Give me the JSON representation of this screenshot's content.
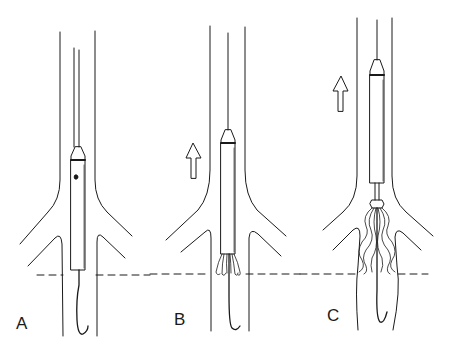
{
  "panels": [
    {
      "label": "A",
      "label_x": 16,
      "label_y": 314
    },
    {
      "label": "B",
      "label_x": 174,
      "label_y": 310
    },
    {
      "label": "C",
      "label_x": 327,
      "label_y": 306
    }
  ],
  "colors": {
    "line": "#1a1a1a",
    "background": "#ffffff"
  },
  "reference_line": {
    "style": "dashed",
    "y": 274
  }
}
